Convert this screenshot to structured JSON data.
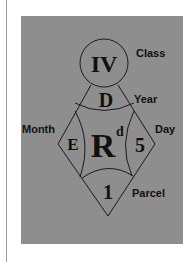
{
  "labels": {
    "class": "Class",
    "year": "Year",
    "month": "Month",
    "day": "Day",
    "parcel": "Parcel"
  },
  "codes": {
    "class": "IV",
    "year": "D",
    "month": "E",
    "center": "R",
    "center_superscript": "d",
    "day": "5",
    "parcel": "1"
  },
  "colors": {
    "panel": "#8e8e8e",
    "line": "#1a1a1a",
    "background": "#ffffff"
  }
}
